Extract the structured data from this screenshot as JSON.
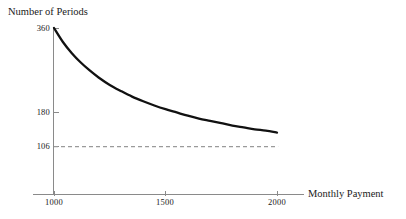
{
  "chart_data": {
    "type": "line",
    "title": "",
    "xlabel": "Monthly Payment",
    "ylabel": "Number of Periods",
    "xlim": [
      910,
      2050
    ],
    "ylim": [
      0,
      372
    ],
    "grid": false,
    "legend": null,
    "xticks": [
      {
        "value": 1000,
        "label": "1000"
      },
      {
        "value": 1500,
        "label": "1500"
      },
      {
        "value": 2000,
        "label": "2000"
      }
    ],
    "yticks": [
      {
        "value": 360,
        "label": "360"
      },
      {
        "value": 180,
        "label": "180"
      },
      {
        "value": 106,
        "label": "106"
      }
    ],
    "series": [
      {
        "name": "Number of Periods",
        "style": "solid",
        "color": "#111111",
        "x": [
          1000,
          1040,
          1080,
          1120,
          1160,
          1200,
          1250,
          1300,
          1350,
          1400,
          1450,
          1500,
          1550,
          1600,
          1650,
          1700,
          1750,
          1800,
          1850,
          1900,
          1950,
          2000
        ],
        "values": [
          360,
          330,
          306,
          286,
          269,
          254,
          238,
          225,
          213,
          203,
          194,
          186,
          179,
          172,
          166,
          161,
          156,
          151,
          147,
          143,
          140,
          136
        ]
      }
    ],
    "annotations": [
      {
        "type": "horizontal-dashed-asymptote",
        "value": 106,
        "label": "106",
        "color": "#9a9a9a",
        "x_start": 1000,
        "x_end": 2005
      }
    ]
  },
  "axes": {
    "y_title": "Number of Periods",
    "x_title": "Monthly Payment"
  }
}
